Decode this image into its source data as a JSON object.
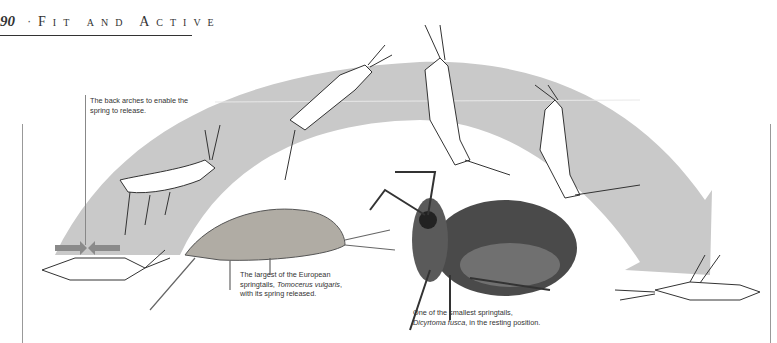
{
  "header": {
    "page_number": "90",
    "separator": "·",
    "running_title_parts": [
      {
        "cap": "F",
        "rest": "IT"
      },
      {
        "cap": "",
        "rest": "AND"
      },
      {
        "cap": "A",
        "rest": "CTIVE"
      }
    ]
  },
  "captions": {
    "back_arches": "The back arches to enable the spring to release.",
    "tomocerus_line1": "The largest of the European",
    "tomocerus_line2_pre": "springtails, ",
    "tomocerus_species": "Tomocerus vulgaris",
    "tomocerus_line2_post": ",",
    "tomocerus_line3": "with its spring released.",
    "dicyrtoma_line1": "One of the smallest springtails,",
    "dicyrtoma_species": "Dicyrtoma fusca",
    "dicyrtoma_line2_post": ", in the resting position."
  },
  "colors": {
    "arrow_fill": "#c9c9c9",
    "small_arrows": "#8a8a8a",
    "ink": "#333333"
  }
}
